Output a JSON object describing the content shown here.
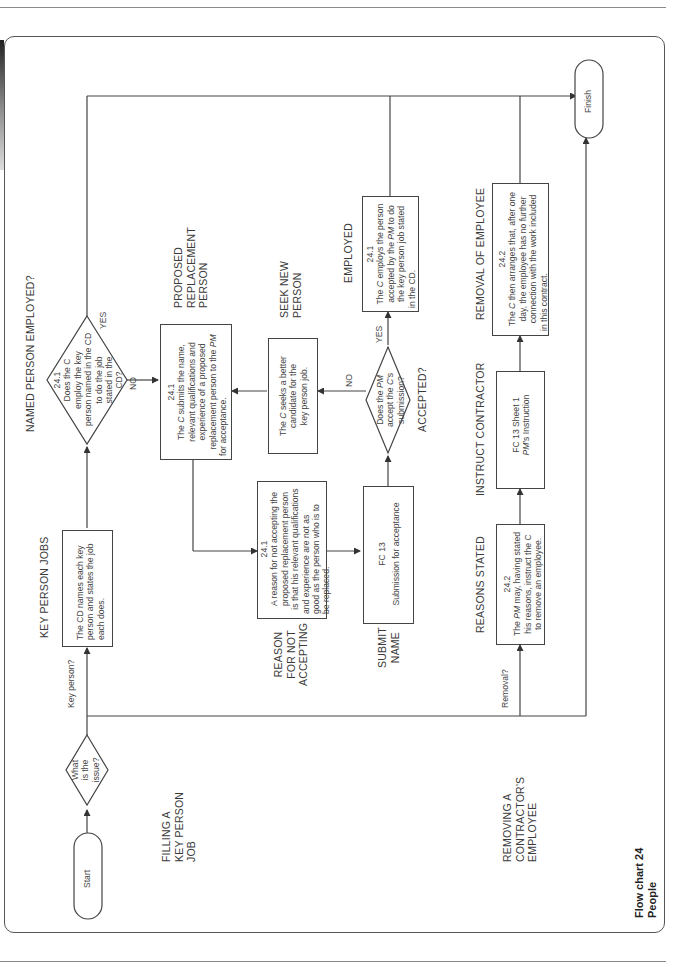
{
  "chart": {
    "title_line1": "Flow chart 24",
    "title_line2": "People"
  },
  "sections": {
    "filling": [
      "FILLING A",
      "KEY PERSON",
      "JOB"
    ],
    "removing": [
      "REMOVING A",
      "CONTRACTOR'S",
      "EMPLOYEE"
    ]
  },
  "terminals": {
    "start": "Start",
    "finish": "Finish"
  },
  "decisions": {
    "issue": [
      "What",
      "is the",
      "issue?"
    ],
    "named": [
      "24.1",
      "Does the C",
      "employ the key",
      "person named in the CD",
      "to do the job",
      "stated in the",
      "CD?"
    ],
    "accepted": [
      "Does the PM",
      "accept the C's",
      "submission?"
    ]
  },
  "branch_labels": {
    "key_person": "Key person?",
    "removal": "Removal?",
    "yes": "YES",
    "no": "NO"
  },
  "headings": {
    "key_person_jobs": "KEY PERSON JOBS",
    "named_person_employed": "NAMED PERSON EMPLOYED?",
    "proposed_replacement": [
      "PROPOSED",
      "REPLACEMENT",
      "PERSON"
    ],
    "seek_new_person": [
      "SEEK NEW",
      "PERSON"
    ],
    "employed": "EMPLOYED",
    "reason_for_not_accepting": [
      "REASON",
      "FOR NOT",
      "ACCEPTING"
    ],
    "submit_name": [
      "SUBMIT",
      "NAME"
    ],
    "accepted": "ACCEPTED?",
    "reasons_stated": "REASONS STATED",
    "instruct_contractor": "INSTRUCT CONTRACTOR",
    "removal_of_employee": "REMOVAL OF EMPLOYEE"
  },
  "boxes": {
    "key_person": [
      "The CD names each key",
      "person and states the job",
      "each does."
    ],
    "proposed": [
      "24.1",
      "The C submits the name,",
      "relevant qualifications and",
      "experience of a proposed",
      "replacement person to the PM",
      "for acceptance."
    ],
    "seek": [
      "The C seeks a better",
      "candidate for the",
      "key person job."
    ],
    "employed": [
      "24.1",
      "The C employs the person",
      "accepted by the PM to do",
      "the key person job stated",
      "in the CD."
    ],
    "reason": [
      "24.1",
      "A reason for not accepting the",
      "proposed replacement person",
      "is that his relevant qualifications",
      "and experience are not as",
      "good as the person who is to",
      "be replaced."
    ],
    "submit": [
      "FC 13",
      "Submission for acceptance"
    ],
    "reasons_stated": [
      "24.2",
      "The PM may, having stated",
      "his reasons, instruct the C",
      "to remove an employee."
    ],
    "instruct": [
      "FC 13 Sheet 1",
      "PM's Instruction"
    ],
    "removal": [
      "24.2",
      "The C then arranges that, after one",
      "day, the employee has no further",
      "connection with the work included",
      "in this contract."
    ]
  }
}
